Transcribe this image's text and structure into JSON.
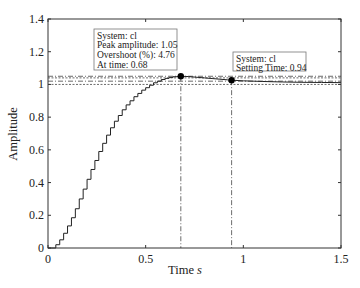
{
  "chart_data": {
    "type": "line",
    "title": "",
    "xlabel": "Time",
    "xlabel_unit": "s",
    "ylabel": "Amplitude",
    "xlim": [
      0,
      1.5
    ],
    "ylim": [
      0,
      1.4
    ],
    "xticks": [
      0,
      0.5,
      1,
      1.5
    ],
    "xtick_labels": [
      "0",
      "0.5",
      "1",
      "1.5"
    ],
    "yticks": [
      0,
      0.2,
      0.4,
      0.6,
      0.8,
      1,
      1.2,
      1.4
    ],
    "ytick_labels": [
      "0",
      "0.2",
      "0.4",
      "0.6",
      "0.8",
      "1",
      "1.2",
      "1.4"
    ],
    "grid": false,
    "series": [
      {
        "name": "cl",
        "style": "stairs-then-smooth",
        "x": [
          0,
          0.02,
          0.04,
          0.06,
          0.08,
          0.1,
          0.12,
          0.14,
          0.16,
          0.18,
          0.2,
          0.22,
          0.24,
          0.26,
          0.28,
          0.3,
          0.32,
          0.34,
          0.36,
          0.38,
          0.4,
          0.42,
          0.44,
          0.46,
          0.48,
          0.5,
          0.52,
          0.54,
          0.56,
          0.58,
          0.6,
          0.62,
          0.64,
          0.66,
          0.68,
          0.72,
          0.76,
          0.8,
          0.84,
          0.88,
          0.92,
          0.94,
          1.0,
          1.1,
          1.2,
          1.3,
          1.4,
          1.5
        ],
        "values": [
          0,
          0.0,
          0.02,
          0.05,
          0.09,
          0.135,
          0.185,
          0.24,
          0.3,
          0.36,
          0.42,
          0.48,
          0.535,
          0.59,
          0.64,
          0.69,
          0.735,
          0.775,
          0.81,
          0.845,
          0.875,
          0.9,
          0.925,
          0.945,
          0.965,
          0.98,
          0.995,
          1.01,
          1.02,
          1.03,
          1.037,
          1.043,
          1.047,
          1.049,
          1.05,
          1.048,
          1.044,
          1.04,
          1.036,
          1.032,
          1.028,
          1.026,
          1.022,
          1.018,
          1.015,
          1.013,
          1.012,
          1.011
        ]
      }
    ],
    "reference_lines": {
      "horizontal": [
        1.05,
        1.04,
        1.02,
        1.0
      ],
      "vertical": [
        0.68,
        0.94
      ]
    },
    "markers": [
      {
        "name": "peak",
        "x": 0.68,
        "y": 1.05
      },
      {
        "name": "settling",
        "x": 0.94,
        "y": 1.026
      }
    ],
    "annotations": [
      {
        "name": "peak-annotation",
        "lines": [
          "System: cl",
          "Peak amplitude: 1.05",
          "Overshoot (%): 4.76",
          "At time: 0.68"
        ]
      },
      {
        "name": "settling-annotation",
        "lines": [
          "System: cl",
          "Setting Time: 0.94"
        ]
      }
    ]
  }
}
